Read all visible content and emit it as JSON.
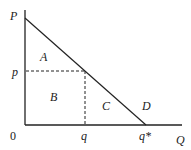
{
  "diagram": {
    "axes": {
      "y_label": "P",
      "x_label": "Q",
      "origin_label": "0"
    },
    "ticks": {
      "price": "p",
      "quantity": "q",
      "quantity_star": "q*"
    },
    "regions": {
      "a": "A",
      "b": "B",
      "c": "C",
      "d": "D"
    },
    "colors": {
      "line": "#222222",
      "background": "#ffffff"
    }
  }
}
